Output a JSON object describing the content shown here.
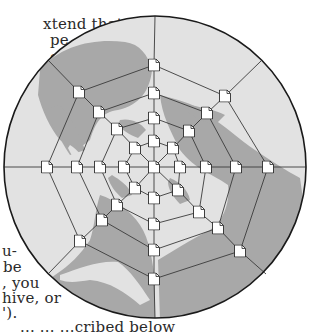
{
  "body_text": {
    "top_lines": [
      {
        "text": "xtend that",
        "x": 43,
        "y": 16
      },
      {
        "text": "pe, you",
        "x": 50,
        "y": 32
      },
      {
        "text": "e the",
        "x": 50,
        "y": 49
      },
      {
        "text": "e",
        "x": 53,
        "y": 82
      }
    ],
    "bottom_lines": [
      {
        "text": "u-",
        "x": 2,
        "y": 243
      },
      {
        "text": "be",
        "x": 3,
        "y": 259
      },
      {
        "text": ", you",
        "x": 2,
        "y": 275
      },
      {
        "text": "hive, or",
        "x": 2,
        "y": 290
      },
      {
        "text": "').",
        "x": 2,
        "y": 305
      },
      {
        "text": "...   ...  ...cribed below",
        "x": 20,
        "y": 319
      }
    ]
  },
  "figure": {
    "type": "polar grid of document nodes over world map (north polar projection)",
    "globe": {
      "cx": 155,
      "cy": 167,
      "r": 151,
      "ocean_color": "#e2e2e2",
      "land_color": "#a8a8a8",
      "outline_color": "#1a1a1a"
    },
    "grid_line_color": "#3a3a3a",
    "node_icon": "document-icon",
    "center_node": [
      154,
      167
    ],
    "rings": [
      {
        "ring": 1,
        "nodes": [
          [
            154,
            141
          ],
          [
            173,
            148
          ],
          [
            180,
            167
          ],
          [
            178,
            190
          ],
          [
            154,
            198
          ],
          [
            135,
            188
          ],
          [
            124,
            167
          ],
          [
            135,
            148
          ]
        ]
      },
      {
        "ring": 2,
        "nodes": [
          [
            154,
            118
          ],
          [
            189,
            131
          ],
          [
            206,
            167
          ],
          [
            199,
            212
          ],
          [
            154,
            224
          ],
          [
            117,
            205
          ],
          [
            100,
            167
          ],
          [
            117,
            129
          ]
        ]
      },
      {
        "ring": 3,
        "nodes": [
          [
            154,
            93
          ],
          [
            207,
            113
          ],
          [
            236,
            167
          ],
          [
            218,
            228
          ],
          [
            154,
            250
          ],
          [
            102,
            220
          ],
          [
            77,
            167
          ],
          [
            99,
            112
          ]
        ]
      },
      {
        "ring": 4,
        "nodes": [
          [
            154,
            65
          ],
          [
            225,
            96
          ],
          [
            268,
            167
          ],
          [
            240,
            251
          ],
          [
            154,
            279
          ],
          [
            80,
            241
          ],
          [
            47,
            167
          ],
          [
            79,
            92
          ]
        ]
      }
    ],
    "spoke_ends": [
      [
        155,
        16
      ],
      [
        261,
        61
      ],
      [
        306,
        167
      ],
      [
        266,
        274
      ],
      [
        155,
        318
      ],
      [
        49,
        273
      ],
      [
        4,
        167
      ],
      [
        48,
        60
      ]
    ]
  }
}
